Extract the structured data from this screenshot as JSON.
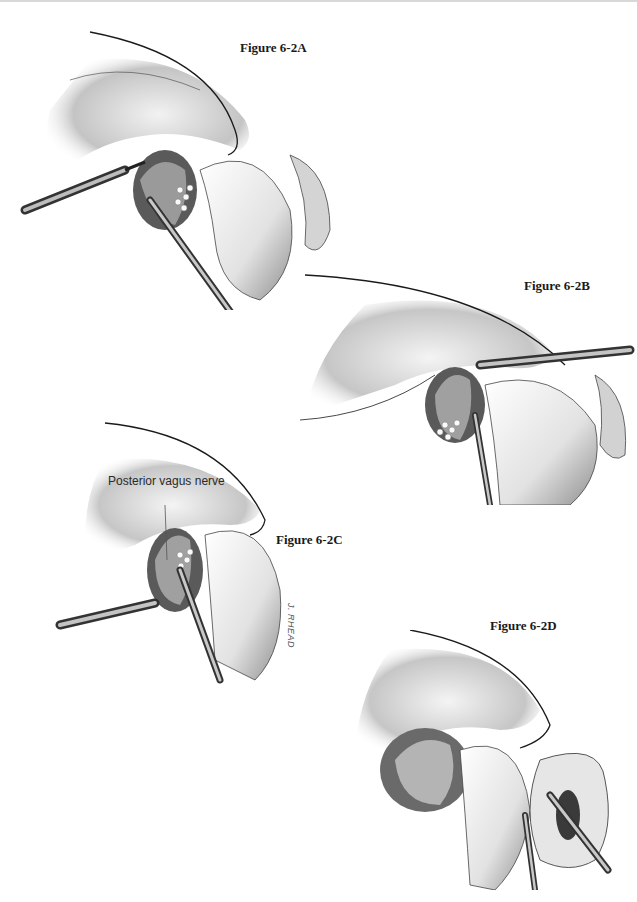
{
  "figures": [
    {
      "id": "A",
      "caption": "Figure 6-2A"
    },
    {
      "id": "B",
      "caption": "Figure 6-2B"
    },
    {
      "id": "C",
      "caption": "Figure 6-2C",
      "annotation": "Posterior vagus nerve",
      "signature": "J. RHEAD"
    },
    {
      "id": "D",
      "caption": "Figure 6-2D"
    }
  ],
  "colors": {
    "ink": "#1a1a1a",
    "tissue_dark": "#6b6b6b",
    "tissue_mid": "#bdbdbd",
    "tissue_light": "#ececec",
    "background": "#ffffff"
  }
}
